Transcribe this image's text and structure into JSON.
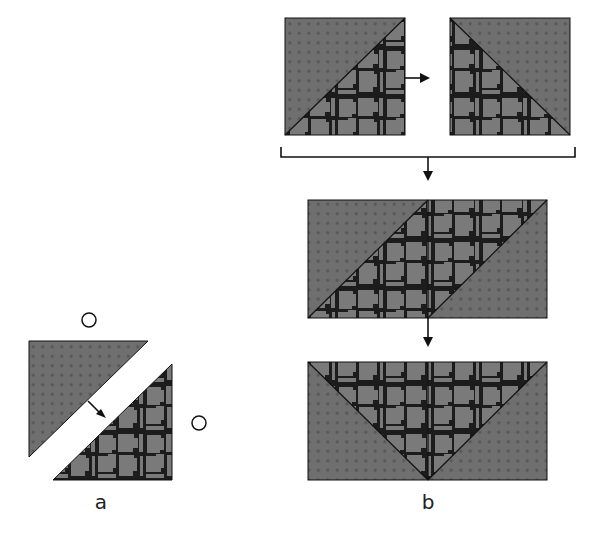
{
  "figure": {
    "panel_a": {
      "label": "a",
      "markers": [
        "O",
        "O"
      ],
      "pieces": [
        {
          "name": "upper-left triangle",
          "texture": "dotted grid"
        },
        {
          "name": "lower-right triangle",
          "texture": "cellular / foam"
        }
      ]
    },
    "panel_b": {
      "label": "b",
      "steps": [
        {
          "name": "two squares split diagonally (textured halves swapped)",
          "arrow": "right"
        },
        {
          "name": "parallelogram arrangement",
          "arrow": "down"
        },
        {
          "name": "inverted triangle arrangement",
          "arrow": "down"
        }
      ]
    },
    "colors": {
      "background": "#ffffff",
      "fill": "#6f6f6f",
      "dot": "#555555",
      "cell_border": "#1a1a1a",
      "cell_fill": "#7a7a7a",
      "stroke": "#111111"
    }
  }
}
